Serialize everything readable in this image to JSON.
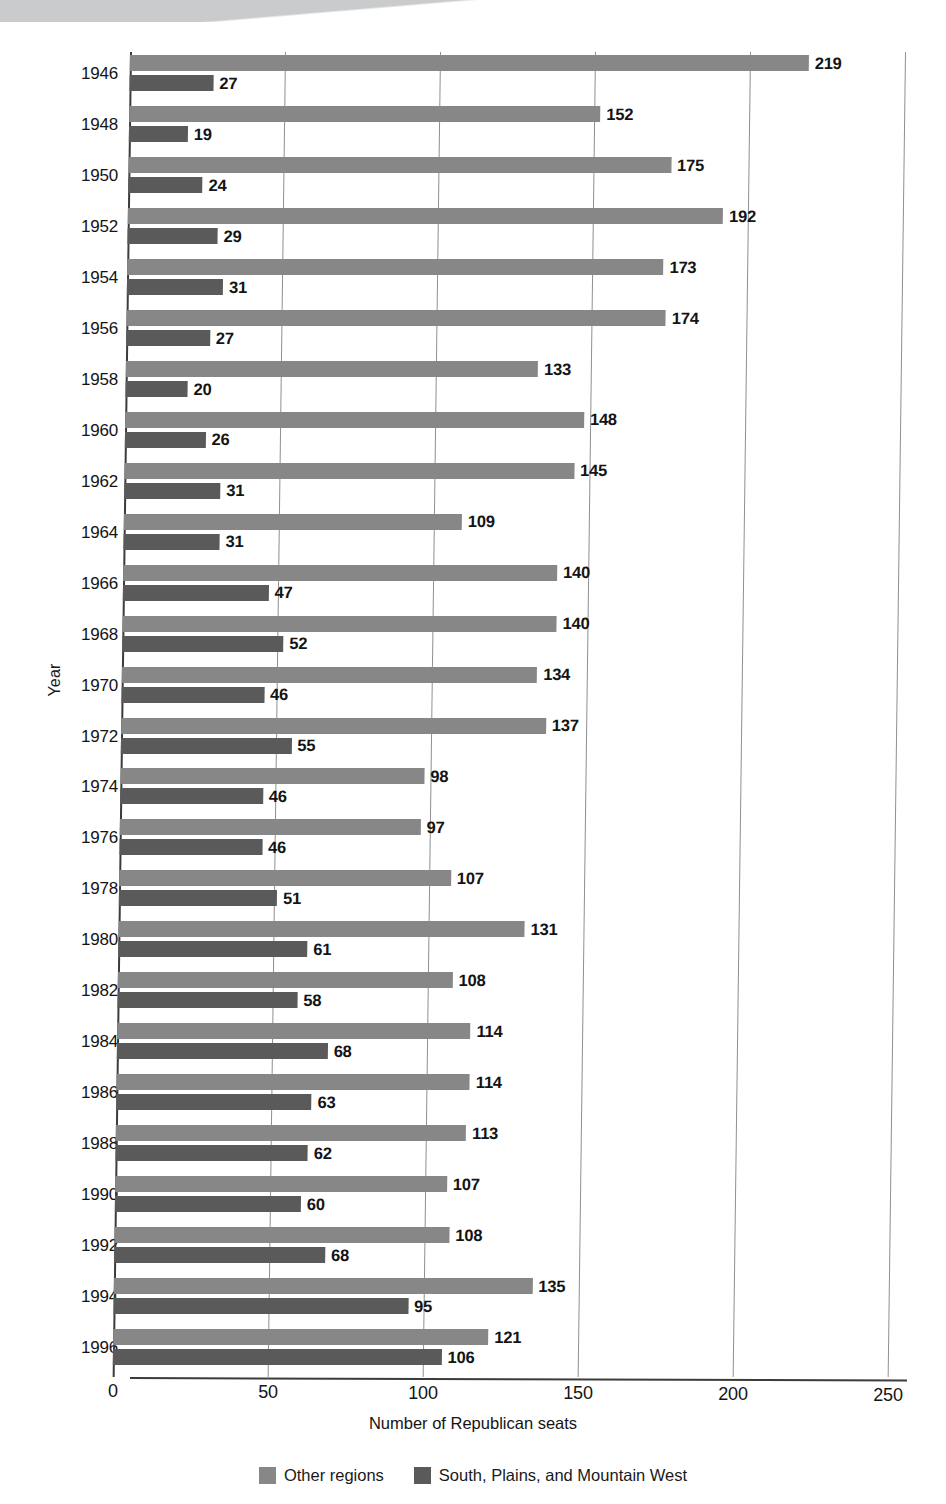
{
  "chart_data": {
    "type": "bar",
    "orientation": "horizontal",
    "grouped": true,
    "title": "",
    "xlabel": "Number of Republican seats",
    "ylabel": "Year",
    "xlim": [
      0,
      250
    ],
    "xticks": [
      0,
      50,
      100,
      150,
      200,
      250
    ],
    "xtick_labels": [
      "0",
      "50",
      "100",
      "150",
      "200",
      "250"
    ],
    "grid": "vertical",
    "legend_position": "bottom",
    "categories": [
      "1946",
      "1948",
      "1950",
      "1952",
      "1954",
      "1956",
      "1958",
      "1960",
      "1962",
      "1964",
      "1966",
      "1968",
      "1970",
      "1972",
      "1974",
      "1976",
      "1978",
      "1980",
      "1982",
      "1984",
      "1986",
      "1988",
      "1990",
      "1992",
      "1994",
      "1996"
    ],
    "series": [
      {
        "name": "Other regions",
        "color": "#878787",
        "values": [
          219,
          152,
          175,
          192,
          173,
          174,
          133,
          148,
          145,
          109,
          140,
          140,
          134,
          137,
          98,
          97,
          107,
          131,
          108,
          114,
          114,
          113,
          107,
          108,
          135,
          121
        ]
      },
      {
        "name": "South, Plains, and Mountain West",
        "color": "#5a5a5a",
        "values": [
          27,
          19,
          24,
          29,
          31,
          27,
          20,
          26,
          31,
          31,
          47,
          52,
          46,
          55,
          46,
          46,
          51,
          61,
          58,
          68,
          63,
          62,
          60,
          68,
          95,
          106
        ]
      }
    ]
  },
  "legend": {
    "items": [
      {
        "label": "Other regions",
        "color": "#878787"
      },
      {
        "label": "South, Plains, and Mountain West",
        "color": "#5a5a5a"
      }
    ]
  }
}
